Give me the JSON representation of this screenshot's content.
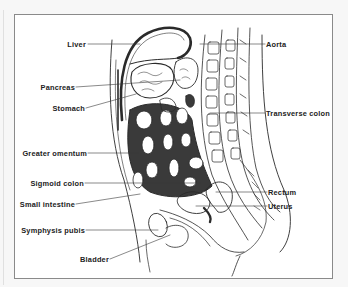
{
  "figure": {
    "labels_left": [
      {
        "id": "liver",
        "text": "Liver"
      },
      {
        "id": "pancreas",
        "text": "Pancreas"
      },
      {
        "id": "stomach",
        "text": "Stomach"
      },
      {
        "id": "greater-omentum",
        "text": "Greater omentum"
      },
      {
        "id": "sigmoid-colon",
        "text": "Sigmoid colon"
      },
      {
        "id": "small-intestine",
        "text": "Small intestine"
      },
      {
        "id": "symphysis-pubis",
        "text": "Symphysis pubis"
      },
      {
        "id": "bladder",
        "text": "Bladder"
      }
    ],
    "labels_right": [
      {
        "id": "aorta",
        "text": "Aorta"
      },
      {
        "id": "transverse-colon",
        "text": "Transverse colon"
      },
      {
        "id": "rectum",
        "text": "Rectum"
      },
      {
        "id": "uterus",
        "text": "Uterus"
      }
    ],
    "colors": {
      "line": "#2a2a2a",
      "frame": "#8a8a8a",
      "background": "#ffffff"
    }
  }
}
